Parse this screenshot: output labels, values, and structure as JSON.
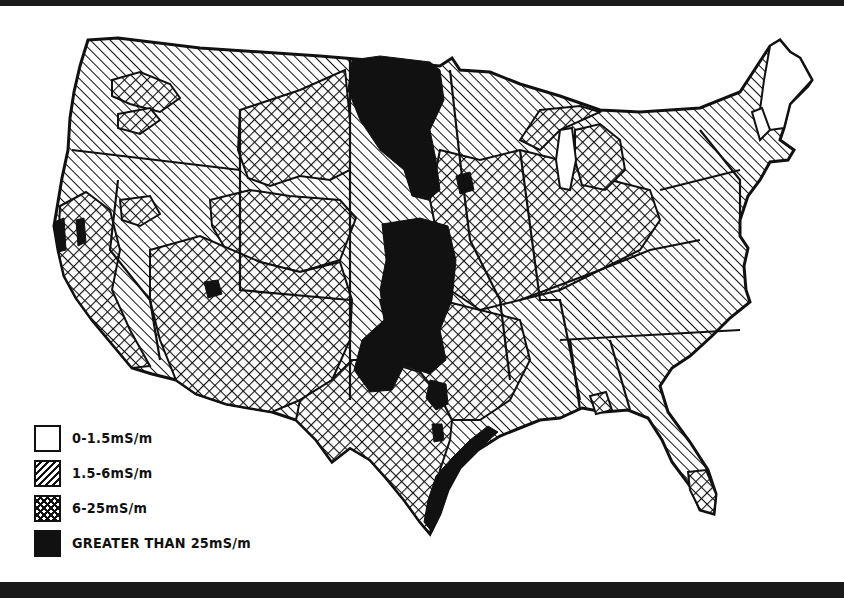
{
  "figure": {
    "colors": {
      "ink": "#111111",
      "paper": "#ffffff",
      "frame": "#1a1a1a"
    }
  },
  "legend": {
    "items": [
      {
        "label": "0-1.5mS/m",
        "fill": "none",
        "icon": "blank-swatch"
      },
      {
        "label": "1.5-6mS/m",
        "fill": "diagonal-hatch",
        "icon": "diagonal-hatch-swatch"
      },
      {
        "label": "6-25mS/m",
        "fill": "cross-hatch",
        "icon": "cross-hatch-swatch"
      },
      {
        "label": "GREATER THAN 25mS/m",
        "fill": "solid",
        "icon": "solid-swatch"
      }
    ]
  },
  "regions": [
    {
      "name": "pacific-northwest",
      "class": "1.5-6mS/m"
    },
    {
      "name": "northern-rockies",
      "class": "1.5-6mS/m"
    },
    {
      "name": "northern-plains-east-band",
      "class": "GREATER THAN 25mS/m"
    },
    {
      "name": "montana-dakota-plains",
      "class": "6-25mS/m"
    },
    {
      "name": "great-basin",
      "class": "1.5-6mS/m"
    },
    {
      "name": "california-central",
      "class": "6-25mS/m"
    },
    {
      "name": "california-coast-pockets",
      "class": "GREATER THAN 25mS/m"
    },
    {
      "name": "southwest-colorado-plateau",
      "class": "6-25mS/m"
    },
    {
      "name": "great-plains-central-band",
      "class": "GREATER THAN 25mS/m"
    },
    {
      "name": "texas",
      "class": "6-25mS/m"
    },
    {
      "name": "gulf-coast-texas",
      "class": "GREATER THAN 25mS/m"
    },
    {
      "name": "midwest",
      "class": "6-25mS/m"
    },
    {
      "name": "upper-great-lakes",
      "class": "1.5-6mS/m"
    },
    {
      "name": "appalachia-east",
      "class": "1.5-6mS/m"
    },
    {
      "name": "southeast",
      "class": "1.5-6mS/m"
    },
    {
      "name": "south-florida",
      "class": "6-25mS/m"
    },
    {
      "name": "new-england-north",
      "class": "0-1.5mS/m"
    }
  ]
}
